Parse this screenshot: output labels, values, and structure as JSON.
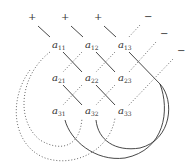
{
  "diagram": {
    "signs_plus": [
      {
        "text": "+",
        "x": 31,
        "y": 20
      },
      {
        "text": "+",
        "x": 64,
        "y": 20
      },
      {
        "text": "+",
        "x": 97,
        "y": 20
      }
    ],
    "signs_minus": [
      {
        "text": "−",
        "x": 147,
        "y": 20
      },
      {
        "text": "−",
        "x": 163,
        "y": 37
      },
      {
        "text": "−",
        "x": 180,
        "y": 54
      }
    ],
    "entries": [
      {
        "base": "a",
        "sub": "11",
        "x": 54,
        "y": 47
      },
      {
        "base": "a",
        "sub": "12",
        "x": 87,
        "y": 47
      },
      {
        "base": "a",
        "sub": "13",
        "x": 120,
        "y": 47
      },
      {
        "base": "a",
        "sub": "21",
        "x": 54,
        "y": 80
      },
      {
        "base": "a",
        "sub": "22",
        "x": 87,
        "y": 80
      },
      {
        "base": "a",
        "sub": "23",
        "x": 120,
        "y": 80
      },
      {
        "base": "a",
        "sub": "31",
        "x": 54,
        "y": 113
      },
      {
        "base": "a",
        "sub": "32",
        "x": 87,
        "y": 113
      },
      {
        "base": "a",
        "sub": "33",
        "x": 120,
        "y": 113
      }
    ],
    "colors": {
      "solid": "#333333",
      "dotted": "#555555",
      "text": "#333333"
    }
  }
}
